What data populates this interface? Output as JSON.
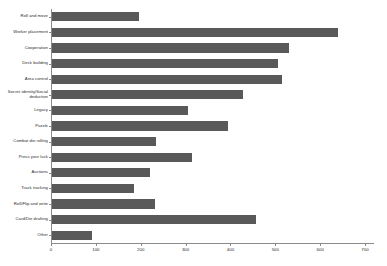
{
  "chart_data": {
    "type": "bar",
    "orientation": "horizontal",
    "title": "",
    "subtitle": "",
    "xlabel": "",
    "ylabel": "",
    "xlim": [
      0,
      720
    ],
    "ylim": null,
    "grid": false,
    "legend": null,
    "bar_color": "#595959",
    "axis_color": "#8a8a8a",
    "background": "#ffffff",
    "xticks": [
      0,
      100,
      200,
      300,
      400,
      500,
      600,
      700
    ],
    "xticklabels": [
      "0",
      "100",
      "200",
      "300",
      "400",
      "500",
      "600",
      "700"
    ],
    "categories": [
      "Roll and move",
      "Worker placement",
      "Cooperation",
      "Deck building",
      "Area control",
      "Secret identity/Social deduction",
      "Legacy",
      "Puzzle",
      "Combat die rolling",
      "Press your luck",
      "Auctions",
      "Track tracking",
      "Roll/Flip and write",
      "Card/Die drafting",
      "Other"
    ],
    "values": [
      197,
      640,
      530,
      505,
      515,
      428,
      305,
      395,
      235,
      315,
      220,
      185,
      232,
      456,
      92
    ]
  }
}
